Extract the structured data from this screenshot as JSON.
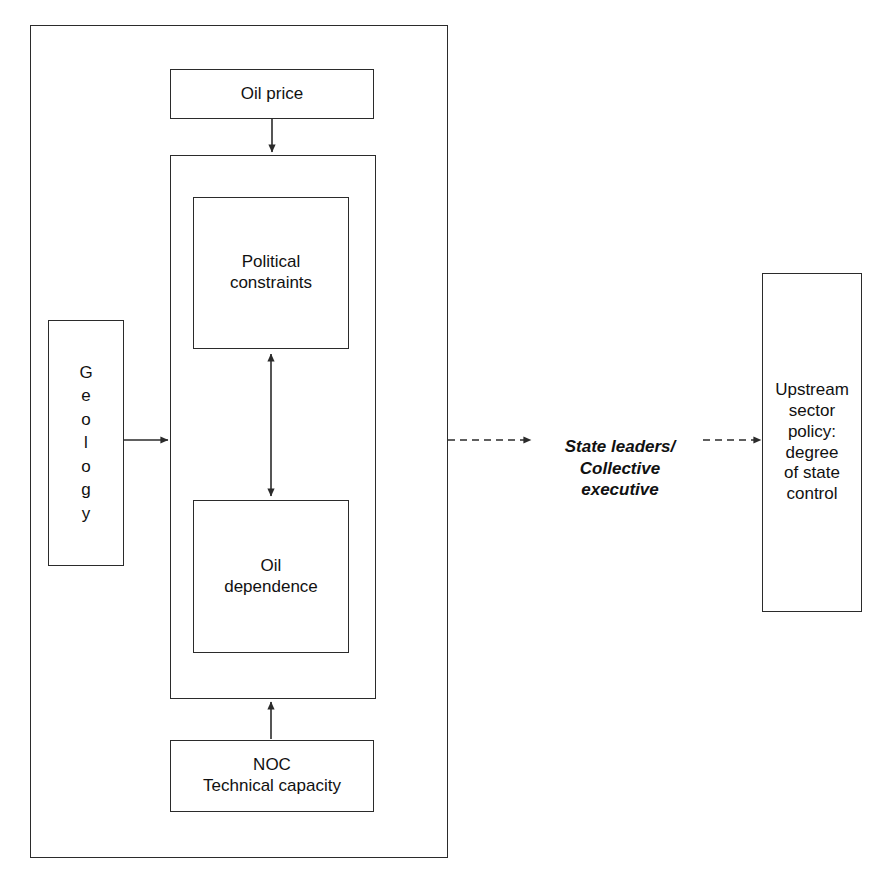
{
  "diagram": {
    "stroke_color": "#2b2b2b",
    "background_color": "#ffffff",
    "nodes": {
      "outer_frame": {
        "label": ""
      },
      "oil_price": {
        "label": "Oil price"
      },
      "drivers_container": {
        "label": ""
      },
      "political_constraints": {
        "label": "Political\nconstraints"
      },
      "oil_dependence": {
        "label": "Oil\ndependence"
      },
      "geology": {
        "label": "G\ne\no\nl\no\ng\ny"
      },
      "noc": {
        "label": "NOC\nTechnical capacity"
      },
      "state_leaders": {
        "label": "State leaders/\nCollective executive"
      },
      "upstream_policy": {
        "label": "Upstream\nsector\npolicy:\ndegree\nof state\ncontrol"
      }
    },
    "connectors": [
      {
        "name": "oil-price-to-drivers",
        "from": "oil_price",
        "to": "drivers_container",
        "style": "solid",
        "heads": "single",
        "direction": "down"
      },
      {
        "name": "geology-to-drivers",
        "from": "geology",
        "to": "drivers_container",
        "style": "solid",
        "heads": "single",
        "direction": "right"
      },
      {
        "name": "political-constraints-oil-dependence",
        "from": "political_constraints",
        "to": "oil_dependence",
        "style": "solid",
        "heads": "double",
        "direction": "vertical"
      },
      {
        "name": "noc-to-drivers",
        "from": "noc",
        "to": "drivers_container",
        "style": "solid",
        "heads": "single",
        "direction": "up"
      },
      {
        "name": "frame-to-state-leaders",
        "from": "outer_frame",
        "to": "state_leaders",
        "style": "dashed",
        "heads": "single",
        "direction": "right"
      },
      {
        "name": "state-leaders-to-upstream-policy",
        "from": "state_leaders",
        "to": "upstream_policy",
        "style": "dashed",
        "heads": "single",
        "direction": "right"
      }
    ]
  }
}
